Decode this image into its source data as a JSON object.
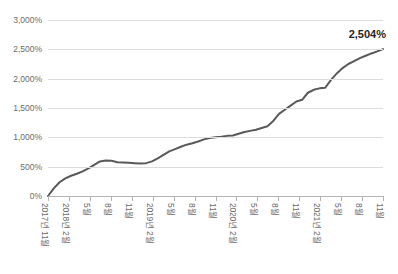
{
  "chart_data": {
    "type": "line",
    "title": "",
    "xlabel": "",
    "ylabel": "",
    "ylim": [
      0,
      3000
    ],
    "grid": true,
    "legend": false,
    "end_label": "2,504%",
    "line_color": "#595959",
    "grid_color": "#dcdcdc",
    "y_ticks": [
      0,
      500,
      1000,
      1500,
      2000,
      2500,
      3000
    ],
    "y_tick_labels": [
      "0%",
      "500%",
      "1,000%",
      "1,500%",
      "2,000%",
      "2,500%",
      "3,000%"
    ],
    "x_tick_labels": [
      "2017년 11월",
      "2018년 2월",
      "5월",
      "8월",
      "11월",
      "2019년 2월",
      "5월",
      "8월",
      "11월",
      "2020년 2월",
      "5월",
      "8월",
      "11월",
      "2021년 2월",
      "5월",
      "8월",
      "11월"
    ],
    "categories": [
      "2017-11",
      "2017-12",
      "2018-01",
      "2018-02",
      "2018-03",
      "2018-04",
      "2018-05",
      "2018-06",
      "2018-07",
      "2018-08",
      "2018-09",
      "2018-10",
      "2018-11",
      "2018-12",
      "2019-01",
      "2019-02",
      "2019-03",
      "2019-04",
      "2019-05",
      "2019-06",
      "2019-07",
      "2019-08",
      "2019-09",
      "2019-10",
      "2019-11",
      "2019-12",
      "2020-01",
      "2020-02",
      "2020-03",
      "2020-04",
      "2020-05",
      "2020-06",
      "2020-07",
      "2020-08",
      "2020-09",
      "2020-10",
      "2020-11",
      "2020-12",
      "2021-01",
      "2021-02",
      "2021-03",
      "2021-04",
      "2021-05",
      "2021-06",
      "2021-07",
      "2021-08",
      "2021-09",
      "2021-10",
      "2021-11"
    ],
    "values": [
      0,
      130,
      235,
      300,
      345,
      380,
      420,
      470,
      530,
      590,
      605,
      600,
      575,
      570,
      565,
      560,
      555,
      560,
      590,
      640,
      700,
      760,
      800,
      840,
      875,
      900,
      930,
      965,
      990,
      1000,
      1010,
      1025,
      1030,
      1060,
      1090,
      1110,
      1130,
      1160,
      1190,
      1280,
      1400,
      1470,
      1540,
      1610,
      1640,
      1760,
      1810,
      1835,
      1845
    ],
    "values_tail": [
      1980,
      2090,
      2180,
      2250,
      2300,
      2350,
      2390,
      2430,
      2465,
      2504
    ],
    "final_value": 2504,
    "unit": "%"
  }
}
